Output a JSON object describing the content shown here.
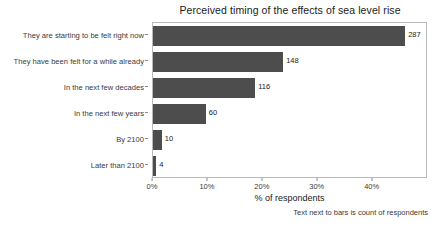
{
  "chart_data": {
    "type": "bar",
    "orientation": "horizontal",
    "title": "Perceived timing of the effects of sea level rise",
    "xlabel": "% of respondents",
    "ylabel": "",
    "caption": "Text next to bars is count of respondents",
    "categories": [
      "They are starting to be felt right now",
      "They have been felt for a while already",
      "In the next few decades",
      "In the next few years",
      "By 2100",
      "Later than 2100"
    ],
    "values": [
      45.9,
      23.7,
      18.6,
      9.6,
      1.6,
      0.6
    ],
    "counts": [
      287,
      148,
      116,
      60,
      10,
      4
    ],
    "count_labels": [
      "287",
      "148",
      "116",
      "60",
      "10",
      "4"
    ],
    "xlim": [
      0,
      49.7
    ],
    "xticks": [
      0,
      10,
      20,
      30,
      40
    ],
    "xtick_labels": [
      "0%",
      "10%",
      "20%",
      "30%",
      "40%"
    ],
    "grid": false,
    "legend": null,
    "bar_color": "#4d4d4d",
    "plot_background": "#ffffff",
    "border_color": "#b9b9b9"
  }
}
